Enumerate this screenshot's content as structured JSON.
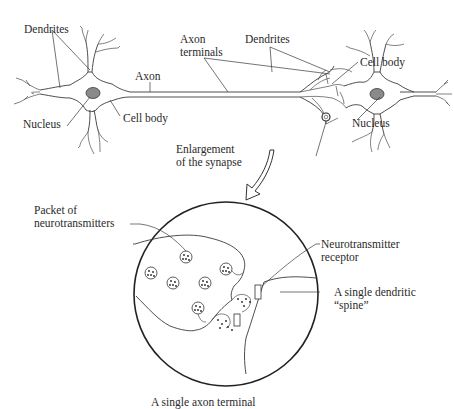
{
  "figure": {
    "type": "neuron-synapse-diagram",
    "top_panel": {
      "left_neuron_labels": {
        "dendrites": "Dendrites",
        "axon": "Axon",
        "nucleus": "Nucleus",
        "cell_body": "Cell body"
      },
      "center_labels": {
        "axon_terminals_line1": "Axon",
        "axon_terminals_line2": "terminals"
      },
      "right_neuron_labels": {
        "dendrites": "Dendrites",
        "cell_body": "Cell body",
        "nucleus": "Nucleus"
      },
      "enlargement_line1": "Enlargement",
      "enlargement_line2": "of the synapse"
    },
    "bottom_panel": {
      "packet_line1": "Packet of",
      "packet_line2": "neurotransmitters",
      "receptor_line1": "Neurotransmitter",
      "receptor_line2": "receptor",
      "spine_line1": "A single dendritic",
      "spine_line2": "“spine”",
      "caption": "A single axon terminal"
    },
    "colors": {
      "line": "#3a3a3a",
      "nucleus_fill": "#8a8a8a",
      "background": "#ffffff"
    }
  }
}
